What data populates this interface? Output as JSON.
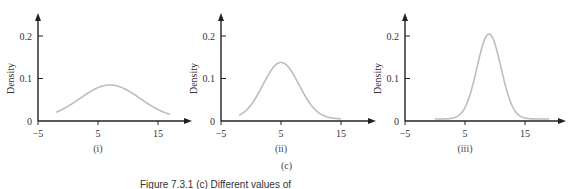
{
  "figure": {
    "panel_group_label": "(c)",
    "caption": "Figure 7.3.1 (c) Different values of"
  },
  "chart_data": [
    {
      "type": "line",
      "panel_label": "(i)",
      "ylabel": "Density",
      "xlabel": "",
      "x_ticks": [
        "-5",
        "5",
        "15"
      ],
      "y_ticks": [
        "0",
        "0.1",
        "0.2"
      ],
      "xlim": [
        -5,
        20
      ],
      "ylim": [
        0,
        0.25
      ],
      "grid": false,
      "curve": {
        "kind": "normal",
        "mean": 7,
        "sd": 5,
        "peak": 0.08,
        "x_start": -2,
        "x_end": 17
      },
      "color": "#bdbdbd"
    },
    {
      "type": "line",
      "panel_label": "(ii)",
      "ylabel": "Density",
      "xlabel": "",
      "x_ticks": [
        "-5",
        "5",
        "15"
      ],
      "y_ticks": [
        "0",
        "0.1",
        "0.2"
      ],
      "xlim": [
        -5,
        20
      ],
      "ylim": [
        0,
        0.25
      ],
      "grid": false,
      "curve": {
        "kind": "normal",
        "mean": 5,
        "sd": 3,
        "peak": 0.133,
        "x_start": -2,
        "x_end": 15
      },
      "color": "#bdbdbd"
    },
    {
      "type": "line",
      "panel_label": "(iii)",
      "ylabel": "Density",
      "xlabel": "",
      "x_ticks": [
        "-5",
        "5",
        "15"
      ],
      "y_ticks": [
        "0",
        "0.1",
        "0.2"
      ],
      "xlim": [
        -5,
        20
      ],
      "ylim": [
        0,
        0.25
      ],
      "grid": false,
      "curve": {
        "kind": "normal",
        "mean": 9,
        "sd": 2,
        "peak": 0.2,
        "x_start": 0,
        "x_end": 19
      },
      "color": "#bdbdbd"
    }
  ]
}
